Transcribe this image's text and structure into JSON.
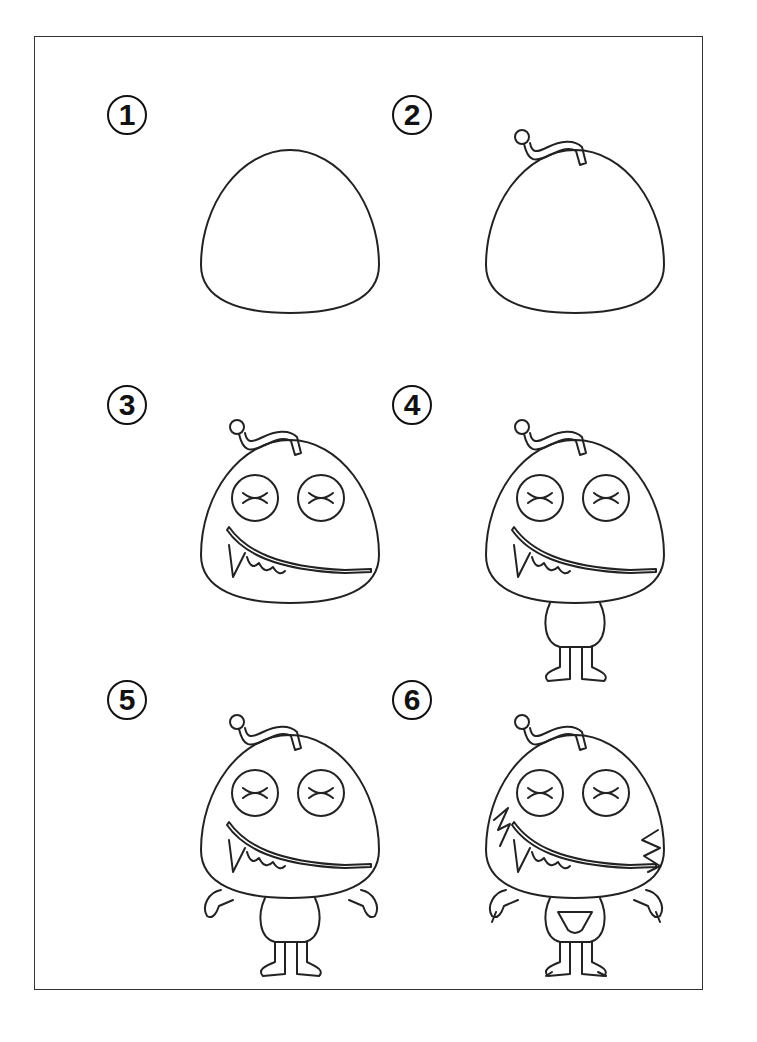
{
  "sheet": {
    "title": "How to draw a monster",
    "line_color": "#222222",
    "border_color": "#333333"
  },
  "steps": [
    {
      "number": "1",
      "parts": [
        "head"
      ]
    },
    {
      "number": "2",
      "parts": [
        "head",
        "antenna"
      ]
    },
    {
      "number": "3",
      "parts": [
        "head",
        "antenna",
        "eyes",
        "mouth"
      ]
    },
    {
      "number": "4",
      "parts": [
        "head",
        "antenna",
        "eyes",
        "mouth",
        "body",
        "legs"
      ]
    },
    {
      "number": "5",
      "parts": [
        "head",
        "antenna",
        "eyes",
        "mouth",
        "body",
        "legs",
        "arms"
      ]
    },
    {
      "number": "6",
      "parts": [
        "head",
        "antenna",
        "eyes",
        "mouth",
        "body",
        "legs",
        "arms",
        "fur",
        "belly",
        "claws"
      ]
    }
  ]
}
